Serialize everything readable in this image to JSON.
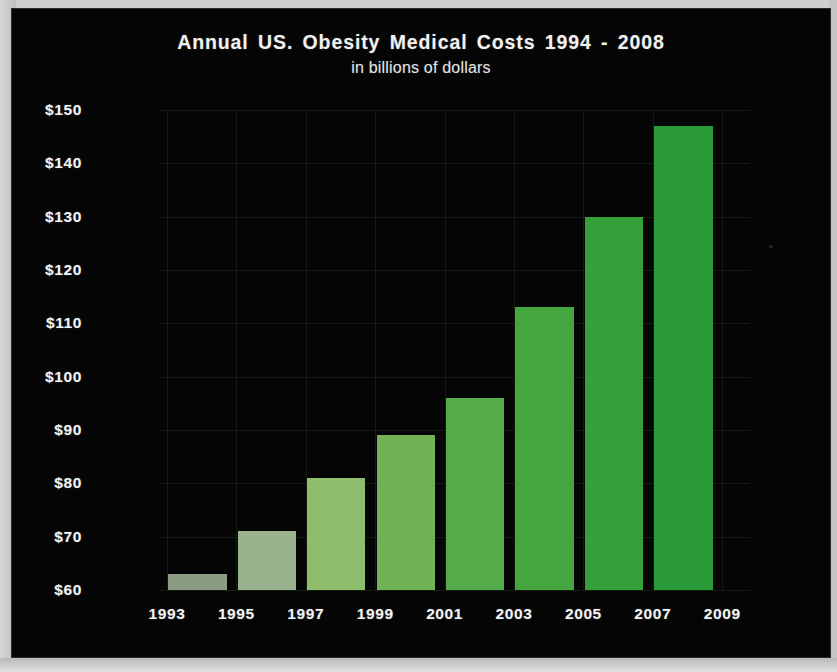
{
  "figure": {
    "title": "Annual US. Obesity Medical Costs 1994 - 2008",
    "subtitle": "in billions of dollars",
    "background_color": "#050505",
    "text_color": "#f4f4f4",
    "gridline_color": "#111c0f",
    "border_color": "#c9c9c9"
  },
  "chart_data": {
    "type": "bar",
    "title": "Annual US. Obesity Medical Costs 1994 - 2008",
    "subtitle": "in billions of dollars",
    "xlabel": "",
    "ylabel": "",
    "categories": [
      "1994",
      "1996",
      "1998",
      "2000",
      "2002",
      "2004",
      "2006",
      "2008"
    ],
    "values": [
      63,
      71,
      81,
      89,
      96,
      113,
      130,
      147
    ],
    "value_labels": [
      "$63",
      "$71",
      "$81",
      "$89",
      "$96",
      "$113",
      "$130",
      "$147"
    ],
    "bar_colors": [
      "#8a9d84",
      "#9ab28e",
      "#8ebd6e",
      "#72b256",
      "#53ab4a",
      "#45a53f",
      "#36a03a",
      "#2a9937"
    ],
    "ylim": [
      60,
      150
    ],
    "yticks": [
      60,
      70,
      80,
      90,
      100,
      110,
      120,
      130,
      140,
      150
    ],
    "ytick_labels": [
      "$60",
      "$70",
      "$80",
      "$90",
      "$100",
      "$110",
      "$120",
      "$130",
      "$140",
      "$150"
    ],
    "xtick_labels": [
      "1993",
      "1995",
      "1997",
      "1999",
      "2001",
      "2003",
      "2005",
      "2007",
      "2009"
    ],
    "grid": true,
    "legend": false
  }
}
